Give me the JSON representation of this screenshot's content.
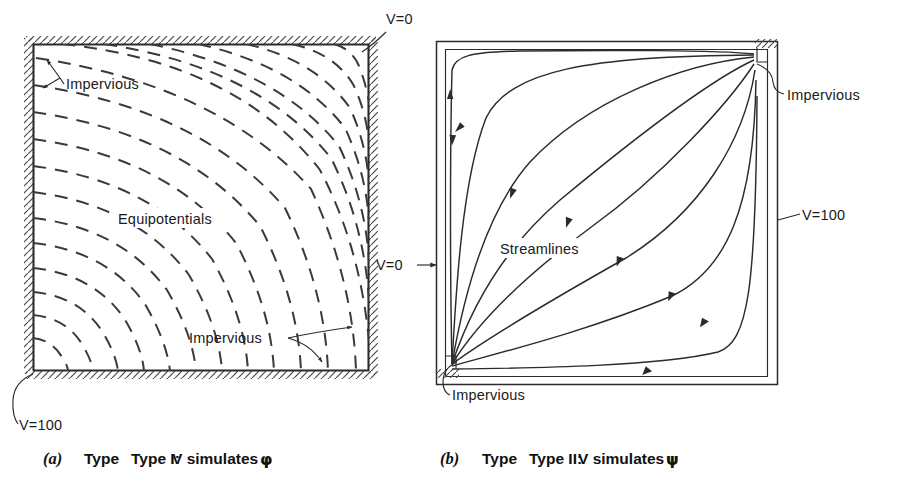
{
  "document": {
    "kind": "textbook-figure",
    "description": "Two square field-plot diagrams comparing Type I and Type II analog field simulations"
  },
  "figure_a": {
    "id": "a",
    "caption_index": "(a)",
    "caption_type": "Type I:",
    "caption_text": "V simulates",
    "caption_symbol": "φ",
    "interior_label": "Equipotentials",
    "boundary_labels": [
      {
        "name": "impervious-top-left",
        "text": "Impervious"
      },
      {
        "name": "impervious-bottom-right",
        "text": "Impervious"
      }
    ],
    "potential_labels": [
      {
        "name": "v-zero",
        "text": "V=0",
        "corner": "top-right"
      },
      {
        "name": "v-hundred",
        "text": "V=100",
        "corner": "bottom-left"
      }
    ],
    "line_style": "dashed",
    "line_count": 18
  },
  "figure_b": {
    "id": "b",
    "caption_index": "(b)",
    "caption_type": "Type II:",
    "caption_text": "V simulates",
    "caption_symbol": "ψ",
    "interior_label": "Streamlines",
    "boundary_labels": [
      {
        "name": "impervious-top-right",
        "text": "Impervious"
      },
      {
        "name": "impervious-bottom-left",
        "text": "Impervious"
      }
    ],
    "potential_labels": [
      {
        "name": "v-zero",
        "text": "V=0",
        "side": "left"
      },
      {
        "name": "v-hundred",
        "text": "V=100",
        "side": "right"
      }
    ],
    "line_style": "solid-with-arrows",
    "line_count": 8
  },
  "colors": {
    "ink": "#2b2b2b",
    "hatch": "#4a4a4a",
    "paper": "#ffffff",
    "text": "#1a1a1a"
  }
}
